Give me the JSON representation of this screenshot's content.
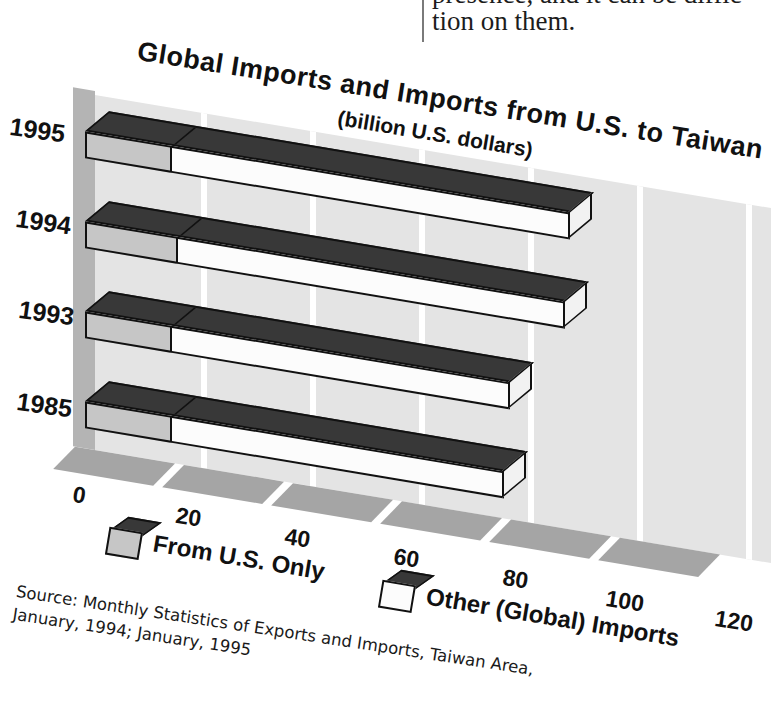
{
  "page": {
    "top_text_line1_clipped": "presence, and it can be diffic",
    "top_text_line2": "tion on them."
  },
  "chart": {
    "title": "Global Imports and Imports from U.S. to Taiwan",
    "subtitle": "(billion U.S. dollars)",
    "legend": {
      "us": "From U.S. Only",
      "other": "Other (Global) Imports"
    },
    "source_line1": "Source: Monthly Statistics of Exports and Imports, Taiwan Area,",
    "source_line2": "January, 1994; January, 1995",
    "colors": {
      "bar_top": "#383838",
      "us_front": "#c6c6c6",
      "other_front": "#fcfcfc",
      "end_face": "#f2f2f2",
      "wall": "#e4e4e4",
      "left_wall": "#b4b4b4",
      "floor": "#a5a5a5",
      "outline": "#111111"
    }
  },
  "chart_data": {
    "type": "bar",
    "orientation": "horizontal",
    "stacked": true,
    "style": "3d-oblique",
    "title": "Global Imports and Imports from U.S. to Taiwan",
    "subtitle": "(billion U.S. dollars)",
    "categories": [
      "1995",
      "1994",
      "1993",
      "1985"
    ],
    "series": [
      {
        "name": "From U.S. Only",
        "values": [
          16,
          17,
          16,
          16
        ]
      },
      {
        "name": "Other (Global) Imports",
        "values": [
          73,
          71,
          62,
          61
        ]
      }
    ],
    "totals": [
      89,
      88,
      78,
      77
    ],
    "xlabel": "billion U.S. dollars",
    "xlim": [
      0,
      120
    ],
    "ticks": [
      0,
      20,
      40,
      60,
      80,
      100,
      120
    ],
    "gridlines": "vertical, every 20, white on gray wall",
    "legend_position": "bottom",
    "source": "Source: Monthly Statistics of Exports and Imports, Taiwan Area, January, 1994; January, 1995"
  }
}
